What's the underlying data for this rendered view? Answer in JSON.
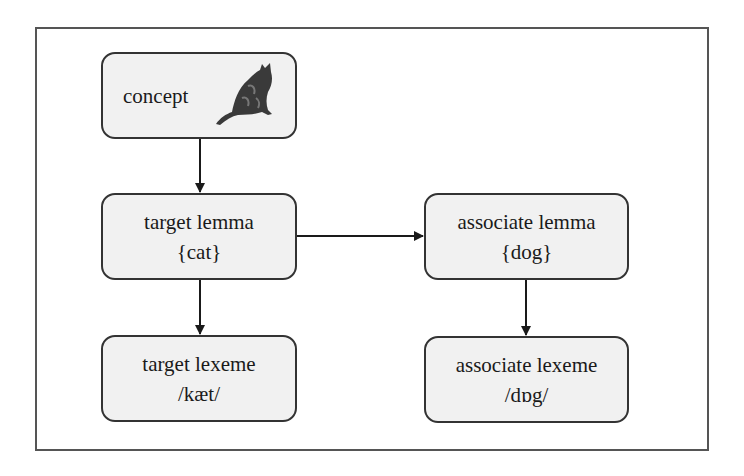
{
  "diagram": {
    "nodes": {
      "concept": {
        "label": "concept",
        "icon": "cat-image-icon"
      },
      "target_lemma": {
        "label": "target lemma",
        "value": "{cat}"
      },
      "associate_lemma": {
        "label": "associate lemma",
        "value": "{dog}"
      },
      "target_lexeme": {
        "label": "target lexeme",
        "value": "/kæt/"
      },
      "associate_lexeme": {
        "label": "associate lexeme",
        "value": "/dɒg/"
      }
    },
    "edges": [
      {
        "from": "concept",
        "to": "target_lemma"
      },
      {
        "from": "target_lemma",
        "to": "associate_lemma"
      },
      {
        "from": "target_lemma",
        "to": "target_lexeme"
      },
      {
        "from": "associate_lemma",
        "to": "associate_lexeme"
      }
    ],
    "colors": {
      "node_fill": "#f1f1f1",
      "node_border": "#333333",
      "frame_border": "#555555",
      "arrow": "#1a1a1a"
    }
  }
}
